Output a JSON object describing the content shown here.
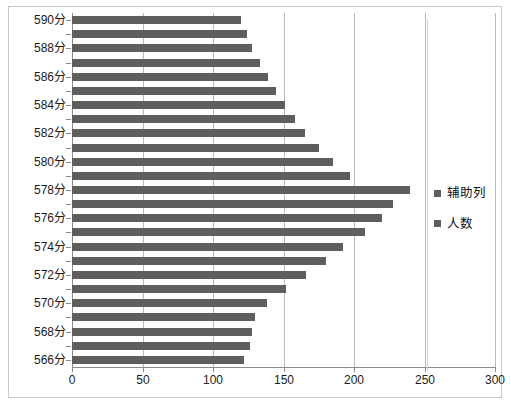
{
  "chart_data": {
    "type": "bar",
    "orientation": "horizontal",
    "title": "",
    "xlabel": "",
    "ylabel": "",
    "xlim": [
      0,
      300
    ],
    "xticks": [
      0,
      50,
      100,
      150,
      200,
      250,
      300
    ],
    "xtick_labels": [
      "0",
      "50",
      "100",
      "150",
      "200",
      "250",
      "300"
    ],
    "grid": true,
    "grid_axis": "x",
    "legend_position": "right",
    "categories": [
      "590分",
      "589分",
      "588分",
      "587分",
      "586分",
      "585分",
      "584分",
      "583分",
      "582分",
      "581分",
      "580分",
      "579分",
      "578分",
      "577分",
      "576分",
      "575分",
      "574分",
      "573分",
      "572分",
      "571分",
      "570分",
      "569分",
      "568分",
      "567分",
      "566分"
    ],
    "category_labels_shown": [
      "590分",
      "588分",
      "586分",
      "584分",
      "582分",
      "580分",
      "578分",
      "576分",
      "574分",
      "572分",
      "570分",
      "568分",
      "566分"
    ],
    "series": [
      {
        "name": "人数",
        "color": "#5e5e5e",
        "values": [
          120,
          124,
          128,
          133,
          139,
          145,
          151,
          158,
          165,
          175,
          185,
          197,
          240,
          228,
          220,
          208,
          192,
          180,
          166,
          152,
          138,
          130,
          128,
          126,
          122
        ]
      }
    ],
    "legend_entries": [
      {
        "label": "辅助列",
        "color": "#5e5e5e"
      },
      {
        "label": "人数",
        "color": "#5e5e5e"
      }
    ]
  }
}
